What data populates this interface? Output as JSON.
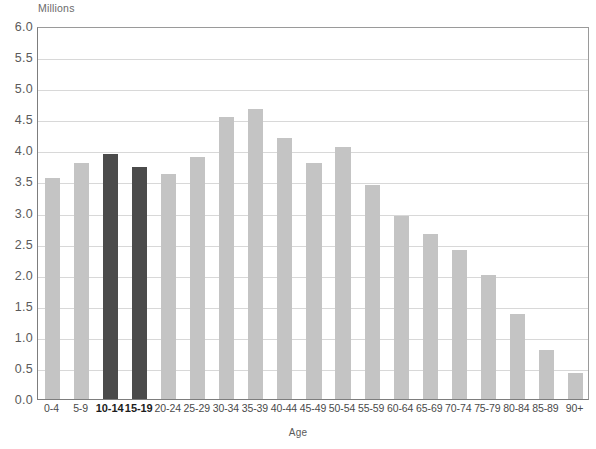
{
  "chart_data": {
    "type": "bar",
    "title": "",
    "unit_label": "Millions",
    "xlabel": "Age",
    "ylabel": "Millions",
    "ylim": [
      0,
      6
    ],
    "ytick_step": 0.5,
    "grid": true,
    "legend": "none",
    "bar_color": "#c4c4c4",
    "highlight_color": "#4b4b4b",
    "highlighted_categories": [
      "10-14",
      "15-19"
    ],
    "categories": [
      "0-4",
      "5-9",
      "10-14",
      "15-19",
      "20-24",
      "25-29",
      "30-34",
      "35-39",
      "40-44",
      "45-49",
      "50-54",
      "55-59",
      "60-64",
      "65-69",
      "70-74",
      "75-79",
      "80-84",
      "85-89",
      "90+"
    ],
    "values": [
      3.55,
      3.8,
      3.94,
      3.74,
      3.62,
      3.9,
      4.53,
      4.66,
      4.2,
      3.8,
      4.05,
      3.45,
      2.94,
      2.65,
      2.39,
      2.0,
      1.36,
      0.79,
      0.42
    ],
    "ytick_labels": [
      "6.0",
      "5.5",
      "5.0",
      "4.5",
      "4.0",
      "3.5",
      "3.0",
      "2.5",
      "2.0",
      "1.5",
      "1.0",
      "0.5",
      "0.0"
    ],
    "ytick_values": [
      6.0,
      5.5,
      5.0,
      4.5,
      4.0,
      3.5,
      3.0,
      2.5,
      2.0,
      1.5,
      1.0,
      0.5,
      0.0
    ]
  }
}
